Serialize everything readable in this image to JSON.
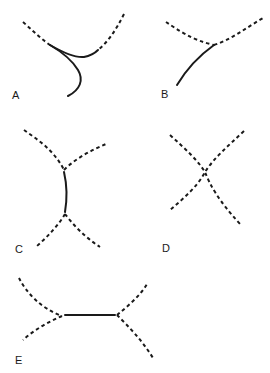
{
  "diagram": {
    "panels": [
      {
        "id": "A",
        "label": "A",
        "description": "Two dashed arcs meeting with a solid curved segment looping downward"
      },
      {
        "id": "B",
        "label": "B",
        "description": "Dashed V-shaped curve with a solid line descending to lower left from the vertex"
      },
      {
        "id": "C",
        "label": "C",
        "description": "Two dashed Y-junctions connected by a short vertical solid segment"
      },
      {
        "id": "D",
        "label": "D",
        "description": "Two dashed curves crossing in an X shape"
      },
      {
        "id": "E",
        "label": "E",
        "description": "Two dashed forks connected by a horizontal solid segment"
      }
    ],
    "colors": {
      "line": "#1a1a1a",
      "background": "#ffffff"
    }
  }
}
